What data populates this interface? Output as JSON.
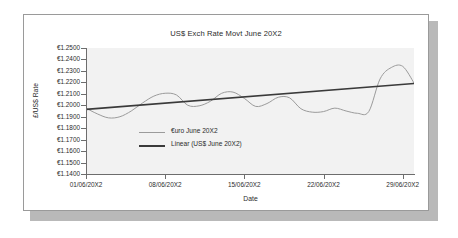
{
  "chart_data": {
    "type": "line",
    "title": "US$ Exch Rate Movt June 20X2",
    "xlabel": "Date",
    "ylabel": "£/US$ Rate",
    "grid": false,
    "legend_position": "inside-center-left",
    "ylim": [
      1.14,
      1.25
    ],
    "ytick_step": 0.01,
    "ytick_labels": [
      "€1.2500",
      "€1.2400",
      "€1.2300",
      "€1.2200",
      "€1.2100",
      "€1.2000",
      "€1.1900",
      "€1.1800",
      "€1.1700",
      "€1.1600",
      "€1.1500",
      "€1.1400"
    ],
    "ytick_values": [
      1.25,
      1.24,
      1.23,
      1.22,
      1.21,
      1.2,
      1.19,
      1.18,
      1.17,
      1.16,
      1.15,
      1.14
    ],
    "xtick_labels": [
      "01/06/20X2",
      "08/06/20X2",
      "15/06/20X2",
      "22/06/20X2",
      "29/06/20X2"
    ],
    "xtick_days": [
      1,
      8,
      15,
      22,
      29
    ],
    "xlim": [
      1,
      30
    ],
    "series": [
      {
        "name": "€uro June 20X2",
        "color": "#9b9b9b",
        "x": [
          1,
          2,
          3,
          4,
          5,
          6,
          7,
          8,
          9,
          10,
          11,
          12,
          13,
          14,
          15,
          16,
          17,
          18,
          19,
          20,
          21,
          22,
          23,
          24,
          25,
          26,
          27,
          28,
          29,
          30
        ],
        "values": [
          1.1975,
          1.1925,
          1.189,
          1.19,
          1.195,
          1.202,
          1.208,
          1.2105,
          1.209,
          1.2,
          1.1995,
          1.2035,
          1.2105,
          1.2115,
          1.206,
          1.199,
          1.2015,
          1.207,
          1.2065,
          1.197,
          1.194,
          1.1945,
          1.1975,
          1.195,
          1.193,
          1.1945,
          1.2065,
          1.214,
          1.2145,
          1.2095
        ]
      },
      {
        "name": "Linear (US$ June 20X2)",
        "color": "#3a3a3a",
        "type": "trendline",
        "x": [
          1,
          30
        ],
        "values": [
          1.1965,
          1.219
        ]
      }
    ],
    "series_extra_points": {
      "note": "late-month peak",
      "x": [
        27,
        28,
        29,
        30
      ],
      "values": [
        1.223,
        1.233,
        1.234,
        1.2195
      ]
    }
  },
  "legend": [
    {
      "label": "€uro June 20X2",
      "style": "series"
    },
    {
      "label": "Linear (US$ June 20X2)",
      "style": "trend"
    }
  ],
  "colors": {
    "series_line": "#9b9b9b",
    "trend_line": "#3a3a3a",
    "plot_background": "#f2f2f2",
    "axis": "#6d6d6d",
    "card_background": "#ffffff",
    "card_border": "#9a9a9a",
    "shadow": "#b9b9b9",
    "text": "#2b2b2b"
  }
}
